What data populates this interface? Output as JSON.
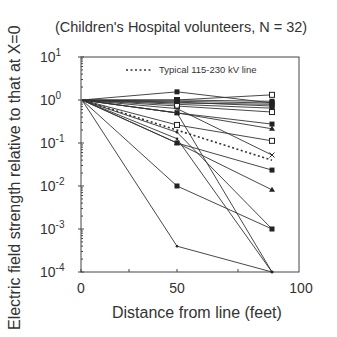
{
  "chart_data": {
    "type": "line",
    "title": "(Children's Hospital volunteers, N = 32)",
    "xlabel": "Distance from line (feet)",
    "ylabel": "Electric field strength relative to that at X=0",
    "xlim": [
      0,
      100
    ],
    "ylim": [
      0.0001,
      10
    ],
    "yscale": "log",
    "grid": false,
    "x_ticks": [
      "0",
      "50",
      "100"
    ],
    "y_ticks": [
      {
        "base": "10",
        "exp": "1"
      },
      {
        "base": "10",
        "exp": "0"
      },
      {
        "base": "10",
        "exp": "-1"
      },
      {
        "base": "10",
        "exp": "-2"
      },
      {
        "base": "10",
        "exp": "-3"
      },
      {
        "base": "10",
        "exp": "-4"
      }
    ],
    "legend": {
      "position": "top-right",
      "entries": [
        {
          "label": "Typical 115-230 kV line",
          "style": "dotted"
        }
      ]
    },
    "x": [
      0,
      45,
      88
    ],
    "series": [
      {
        "name": "volunteer-1",
        "log10_values": [
          0,
          0.19,
          -0.07
        ],
        "marker": "filled-square"
      },
      {
        "name": "volunteer-2",
        "log10_values": [
          0,
          0.0,
          0.12
        ],
        "marker": "open-square"
      },
      {
        "name": "volunteer-3",
        "log10_values": [
          0,
          0.0,
          -0.03
        ],
        "marker": "filled-square"
      },
      {
        "name": "volunteer-4",
        "log10_values": [
          0,
          -0.03,
          -0.07
        ],
        "marker": "filled-square"
      },
      {
        "name": "volunteer-5",
        "log10_values": [
          0,
          -0.07,
          -0.1
        ],
        "marker": "filled-square"
      },
      {
        "name": "volunteer-6",
        "log10_values": [
          0,
          -0.05,
          -0.14
        ],
        "marker": "filled-square"
      },
      {
        "name": "volunteer-7",
        "log10_values": [
          0,
          -0.1,
          -0.19
        ],
        "marker": "filled-square"
      },
      {
        "name": "volunteer-8",
        "log10_values": [
          0,
          -0.14,
          -0.28
        ],
        "marker": "open-square"
      },
      {
        "name": "volunteer-9",
        "log10_values": [
          0,
          -0.3,
          -0.56
        ],
        "marker": "filled-square"
      },
      {
        "name": "volunteer-10",
        "log10_values": [
          0,
          -0.3,
          -0.67
        ],
        "marker": "filled-triangle"
      },
      {
        "name": "volunteer-11",
        "log10_values": [
          0,
          -0.58,
          -0.95
        ],
        "marker": "open-square"
      },
      {
        "name": "volunteer-12",
        "log10_values": [
          0,
          -0.3,
          -4.0
        ],
        "marker": "dot"
      },
      {
        "name": "volunteer-13",
        "log10_values": [
          0,
          -0.2,
          -1.28
        ],
        "marker": "x"
      },
      {
        "name": "volunteer-14",
        "log10_values": [
          0,
          -1.0,
          -1.63
        ],
        "marker": "filled-square"
      },
      {
        "name": "volunteer-15",
        "log10_values": [
          0,
          -1.0,
          -2.09
        ],
        "marker": "filled-triangle"
      },
      {
        "name": "volunteer-16",
        "log10_values": [
          0,
          -0.75,
          -3.0
        ],
        "marker": "dot"
      },
      {
        "name": "volunteer-17",
        "log10_values": [
          0,
          -2.0,
          -3.0
        ],
        "marker": "filled-square"
      },
      {
        "name": "volunteer-18",
        "log10_values": [
          0,
          -3.4,
          -4.0
        ],
        "marker": "dot"
      },
      {
        "name": "volunteer-19",
        "log10_values": [
          0,
          -0.9,
          -4.0
        ],
        "marker": "dot"
      },
      {
        "name": "Typical 115-230 kV line",
        "log10_values": [
          0,
          -0.7,
          -1.4
        ],
        "style": "dotted"
      }
    ]
  }
}
